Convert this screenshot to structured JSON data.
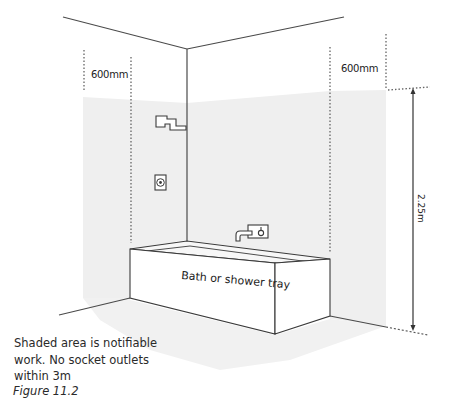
{
  "diagram": {
    "labels": {
      "left_zone_width": "600mm",
      "right_zone_width": "600mm",
      "height_dimension": "2.25m",
      "bath": "Bath or shower tray"
    },
    "note": "Shaded area is notifiable work. No socket outlets within 3m",
    "caption": "Figure 11.2",
    "icons": {
      "shower_head": "shower-head-icon",
      "shower_control": "shower-control-icon",
      "bath_tap": "bath-tap-icon"
    },
    "colors": {
      "shaded_zone": "#efefef",
      "lines": "#4a4a4a",
      "background": "#ffffff"
    }
  }
}
